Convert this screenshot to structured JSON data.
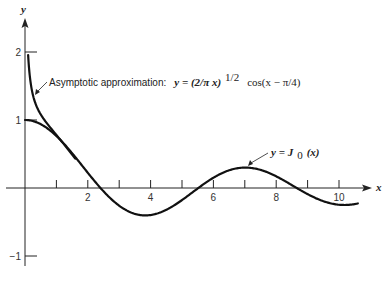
{
  "chart_data": {
    "type": "line",
    "title": "",
    "xlabel": "x",
    "ylabel": "y",
    "xlim": [
      0,
      11.1
    ],
    "ylim": [
      -1.1,
      2.5
    ],
    "grid": false,
    "x_ticks": [
      1,
      2,
      3,
      4,
      5,
      6,
      7,
      8,
      9,
      10
    ],
    "x_tick_labels": [
      {
        "value": 2,
        "label": "2"
      },
      {
        "value": 4,
        "label": "4"
      },
      {
        "value": 6,
        "label": "6"
      },
      {
        "value": 8,
        "label": "8"
      },
      {
        "value": 10,
        "label": "10"
      }
    ],
    "y_ticks": [
      {
        "value": 2,
        "label": "2"
      },
      {
        "value": 1,
        "label": "1"
      },
      {
        "value": -1,
        "label": "−1"
      }
    ],
    "series": [
      {
        "name": "y = J0(x)",
        "function": "bessel_j0",
        "x_range": [
          0,
          10.6
        ],
        "sample_points": [
          [
            0,
            1.0
          ],
          [
            1,
            0.765
          ],
          [
            2,
            0.224
          ],
          [
            2.405,
            0.0
          ],
          [
            3,
            -0.26
          ],
          [
            3.832,
            -0.403
          ],
          [
            5,
            -0.178
          ],
          [
            5.52,
            0.0
          ],
          [
            6,
            0.151
          ],
          [
            7.016,
            0.3
          ],
          [
            8,
            0.172
          ],
          [
            8.654,
            0.0
          ],
          [
            9,
            -0.09
          ],
          [
            10,
            -0.246
          ],
          [
            10.6,
            -0.2
          ]
        ]
      },
      {
        "name": "Asymptotic approximation: y = (2/(pi x))^(1/2) cos(x - pi/4)",
        "function": "asymptotic_j0",
        "x_range": [
          0.1,
          1.6
        ],
        "sample_points": [
          [
            0.1,
            1.813
          ],
          [
            0.2,
            1.566
          ],
          [
            0.3,
            1.359
          ],
          [
            0.5,
            1.048
          ],
          [
            0.75,
            0.761
          ],
          [
            1.0,
            0.643
          ],
          [
            1.3,
            0.426
          ],
          [
            1.6,
            0.199
          ]
        ]
      }
    ],
    "annotations": [
      {
        "text_prefix": "Asymptotic approximation:",
        "math": "y = (2/π x)",
        "superscript": "1/2",
        "math_suffix": "cos(x − π/4)",
        "points_to": [
          0.35,
          1.28
        ]
      },
      {
        "text": "y = J₀(x)",
        "math_main": "y = J",
        "subscript": "0",
        "math_suffix": "(x)",
        "points_to": [
          7.0,
          0.3
        ]
      }
    ],
    "pixel_map": {
      "x0": 25,
      "px_per_x": 31.4,
      "y0": 188,
      "px_per_y": 68
    }
  }
}
